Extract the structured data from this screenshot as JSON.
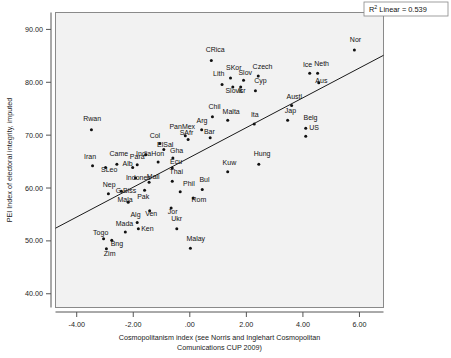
{
  "chart_data": {
    "type": "scatter",
    "title": "",
    "xlabel": "Cosmopolitanism index (see Norris and Inglehart Cosmopolitan Comunications CUP 2009)",
    "xlabel_line1": "Cosmopolitanism index (see Norris and Inglehart Cosmopolitan",
    "xlabel_line2": "Comunications CUP 2009)",
    "ylabel": "PEI Index of electoral integrity, imputed",
    "xlim": [
      -4.75,
      6.85
    ],
    "ylim": [
      37.4,
      93.2
    ],
    "xticks": [
      -4.0,
      -2.0,
      0.0,
      2.0,
      4.0,
      6.0
    ],
    "xticklabels": [
      "-4.00",
      "-2.00",
      ".00",
      "2.00",
      "4.00",
      "6.00"
    ],
    "yticks": [
      40.0,
      50.0,
      60.0,
      70.0,
      80.0,
      90.0
    ],
    "yticklabels": [
      "40.00",
      "50.00",
      "60.00",
      "70.00",
      "80.00",
      "90.00"
    ],
    "grid": false,
    "legend": "none",
    "annotation": {
      "text_prefix": "R",
      "text_sup": "2",
      "text_suffix": " Linear = 0.539",
      "r_squared": 0.539,
      "full_text": "R2 Linear = 0.539"
    },
    "fit_line": {
      "type": "linear",
      "x_start": -4.75,
      "y_start": 52.4,
      "x_end": 6.85,
      "y_end": 85.1
    },
    "point_color": "#111111",
    "plot_background": "#f2f2f2",
    "points": [
      {
        "label": "Rwan",
        "x": -3.48,
        "y": 71.0,
        "lx": -3.77,
        "ly": 72.6
      },
      {
        "label": "Iran",
        "x": -3.44,
        "y": 64.2,
        "lx": -3.74,
        "ly": 65.5
      },
      {
        "label": "SLeo",
        "x": -2.98,
        "y": 63.9,
        "lx": -3.14,
        "ly": 63.0
      },
      {
        "label": "Came",
        "x": -2.58,
        "y": 64.5,
        "lx": -2.84,
        "ly": 66.0
      },
      {
        "label": "Nep",
        "x": -2.88,
        "y": 58.9,
        "lx": -3.08,
        "ly": 60.2
      },
      {
        "label": "Togo",
        "x": -3.05,
        "y": 50.4,
        "lx": -3.42,
        "ly": 51.2
      },
      {
        "label": "Zim",
        "x": -2.95,
        "y": 48.5,
        "lx": -3.04,
        "ly": 47.1
      },
      {
        "label": "Bng",
        "x": -2.76,
        "y": 50.1,
        "lx": -2.8,
        "ly": 49.0
      },
      {
        "label": "Mada",
        "x": -2.28,
        "y": 51.7,
        "lx": -2.62,
        "ly": 52.8
      },
      {
        "label": "G.Biss",
        "x": -2.42,
        "y": 59.4,
        "lx": -2.62,
        "ly": 59.0
      },
      {
        "label": "Mala",
        "x": -2.18,
        "y": 57.3,
        "lx": -2.56,
        "ly": 57.4
      },
      {
        "label": "Alb",
        "x": -2.02,
        "y": 63.9,
        "lx": -2.38,
        "ly": 64.2
      },
      {
        "label": "Indones",
        "x": -1.92,
        "y": 61.9,
        "lx": -2.26,
        "ly": 61.6
      },
      {
        "label": "Alg",
        "x": -1.86,
        "y": 53.5,
        "lx": -2.1,
        "ly": 54.6
      },
      {
        "label": "Ken",
        "x": -1.82,
        "y": 52.3,
        "lx": -1.72,
        "ly": 51.9
      },
      {
        "label": "Para",
        "x": -1.86,
        "y": 64.4,
        "lx": -2.12,
        "ly": 65.4
      },
      {
        "label": "Pak",
        "x": -1.6,
        "y": 59.6,
        "lx": -1.86,
        "ly": 58.0
      },
      {
        "label": "India",
        "x": -1.56,
        "y": 66.3,
        "lx": -1.9,
        "ly": 66.0
      },
      {
        "label": "Mali",
        "x": -1.44,
        "y": 61.1,
        "lx": -1.52,
        "ly": 61.7
      },
      {
        "label": "Ven",
        "x": -1.42,
        "y": 55.7,
        "lx": -1.58,
        "ly": 54.7
      },
      {
        "label": "Hon",
        "x": -1.12,
        "y": 64.9,
        "lx": -1.36,
        "ly": 66.0
      },
      {
        "label": "Col",
        "x": -1.06,
        "y": 68.4,
        "lx": -1.42,
        "ly": 69.5
      },
      {
        "label": "ElSal",
        "x": -0.92,
        "y": 67.3,
        "lx": -1.16,
        "ly": 67.7
      },
      {
        "label": "Jor",
        "x": -0.66,
        "y": 56.2,
        "lx": -0.78,
        "ly": 55.0
      },
      {
        "label": "Thai",
        "x": -0.62,
        "y": 61.3,
        "lx": -0.72,
        "ly": 62.6
      },
      {
        "label": "Ecu",
        "x": -0.62,
        "y": 63.8,
        "lx": -0.7,
        "ly": 64.5
      },
      {
        "label": "Gha",
        "x": -0.6,
        "y": 65.7,
        "lx": -0.7,
        "ly": 66.6
      },
      {
        "label": "Ukr",
        "x": -0.46,
        "y": 52.3,
        "lx": -0.66,
        "ly": 53.8
      },
      {
        "label": "Phil",
        "x": -0.34,
        "y": 59.3,
        "lx": -0.24,
        "ly": 60.3
      },
      {
        "label": "SAfr",
        "x": -0.06,
        "y": 69.2,
        "lx": -0.36,
        "ly": 70.0
      },
      {
        "label": "PanMex",
        "x": -0.16,
        "y": 69.9,
        "lx": -0.72,
        "ly": 71.2
      },
      {
        "label": "Malay",
        "x": 0.02,
        "y": 48.6,
        "lx": -0.12,
        "ly": 50.0
      },
      {
        "label": "Rom",
        "x": 0.12,
        "y": 58.1,
        "lx": 0.06,
        "ly": 57.3
      },
      {
        "label": "Arg",
        "x": 0.42,
        "y": 71.0,
        "lx": 0.24,
        "ly": 72.3
      },
      {
        "label": "Bul",
        "x": 0.44,
        "y": 59.7,
        "lx": 0.34,
        "ly": 61.1
      },
      {
        "label": "Bar",
        "x": 0.72,
        "y": 69.5,
        "lx": 0.5,
        "ly": 70.3
      },
      {
        "label": "CRica",
        "x": 0.76,
        "y": 84.1,
        "lx": 0.56,
        "ly": 85.7
      },
      {
        "label": "Chil",
        "x": 0.8,
        "y": 73.5,
        "lx": 0.66,
        "ly": 75.0
      },
      {
        "label": "Lith",
        "x": 1.14,
        "y": 79.6,
        "lx": 0.82,
        "ly": 81.1
      },
      {
        "label": "Kuw",
        "x": 1.34,
        "y": 63.1,
        "lx": 1.16,
        "ly": 64.4
      },
      {
        "label": "Malta",
        "x": 1.34,
        "y": 72.8,
        "lx": 1.16,
        "ly": 74.0
      },
      {
        "label": "SKor",
        "x": 1.44,
        "y": 80.8,
        "lx": 1.28,
        "ly": 82.3
      },
      {
        "label": "Slovk",
        "x": 1.52,
        "y": 79.1,
        "lx": 1.26,
        "ly": 78.0
      },
      {
        "label": "Isr",
        "x": 1.8,
        "y": 79.1,
        "lx": 1.7,
        "ly": 78.0
      },
      {
        "label": "Slov",
        "x": 1.9,
        "y": 80.4,
        "lx": 1.72,
        "ly": 81.4
      },
      {
        "label": "Ita",
        "x": 2.28,
        "y": 72.1,
        "lx": 2.16,
        "ly": 73.4
      },
      {
        "label": "Cyp",
        "x": 2.32,
        "y": 78.4,
        "lx": 2.28,
        "ly": 79.8
      },
      {
        "label": "Czech",
        "x": 2.42,
        "y": 81.2,
        "lx": 2.22,
        "ly": 82.6
      },
      {
        "label": "Hung",
        "x": 2.44,
        "y": 64.5,
        "lx": 2.26,
        "ly": 66.0
      },
      {
        "label": "Jap",
        "x": 3.46,
        "y": 72.8,
        "lx": 3.36,
        "ly": 74.2
      },
      {
        "label": "Austl",
        "x": 3.6,
        "y": 75.6,
        "lx": 3.42,
        "ly": 76.8
      },
      {
        "label": "Belg",
        "x": 4.1,
        "y": 71.3,
        "lx": 4.02,
        "ly": 72.8
      },
      {
        "label": "US",
        "x": 4.1,
        "y": 69.8,
        "lx": 4.22,
        "ly": 71.0
      },
      {
        "label": "Ice",
        "x": 4.24,
        "y": 81.7,
        "lx": 4.0,
        "ly": 82.9
      },
      {
        "label": "Neth",
        "x": 4.52,
        "y": 81.7,
        "lx": 4.4,
        "ly": 83.0
      },
      {
        "label": "Aus",
        "x": 4.56,
        "y": 79.9,
        "lx": 4.44,
        "ly": 79.9
      },
      {
        "label": "Nor",
        "x": 5.82,
        "y": 86.1,
        "lx": 5.66,
        "ly": 87.6
      }
    ]
  }
}
